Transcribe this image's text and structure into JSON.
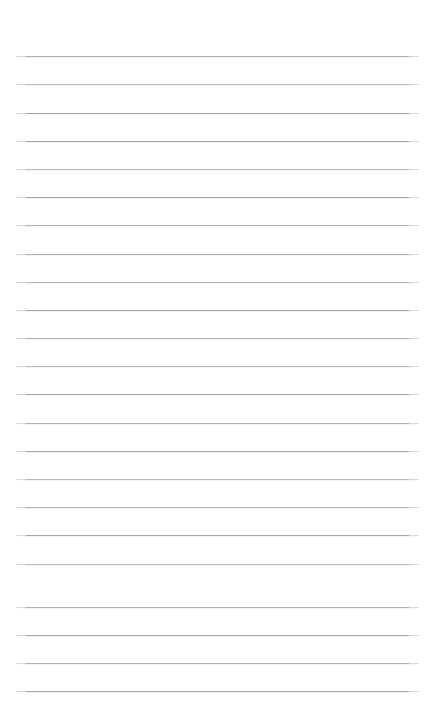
{
  "page": {
    "kind": "lined-note-paper",
    "title": "",
    "subtitle": "",
    "background_color": "#ffffff",
    "width_px": 436,
    "height_px": 721
  },
  "ruling": {
    "line_color": "#ababab",
    "line_color_light": "#b9b9b9",
    "line_color_dark": "#a6a6a6",
    "line_thickness_px": 1,
    "line_count": 23,
    "left_margin_px": 22,
    "right_edge_px": 413,
    "line_width_px": 391,
    "first_line_y_px": 56,
    "line_spacing_px": 28.2,
    "has_vertical_margin_rule": false,
    "has_holes": false,
    "has_header_text": false
  },
  "lines": [
    {
      "index": 1,
      "y": 56,
      "tone": "tone-b",
      "text": ""
    },
    {
      "index": 2,
      "y": 84,
      "tone": "tone-c",
      "text": ""
    },
    {
      "index": 3,
      "y": 113,
      "tone": "tone-a",
      "text": ""
    },
    {
      "index": 4,
      "y": 141,
      "tone": "tone-a",
      "text": ""
    },
    {
      "index": 5,
      "y": 169,
      "tone": "tone-c",
      "text": ""
    },
    {
      "index": 6,
      "y": 197,
      "tone": "tone-a",
      "text": ""
    },
    {
      "index": 7,
      "y": 225,
      "tone": "tone-b",
      "text": ""
    },
    {
      "index": 8,
      "y": 254,
      "tone": "tone-b",
      "text": ""
    },
    {
      "index": 9,
      "y": 282,
      "tone": "tone-c",
      "text": ""
    },
    {
      "index": 10,
      "y": 310,
      "tone": "tone-a",
      "text": ""
    },
    {
      "index": 11,
      "y": 338,
      "tone": "tone-b",
      "text": ""
    },
    {
      "index": 12,
      "y": 366,
      "tone": "tone-c",
      "text": ""
    },
    {
      "index": 13,
      "y": 394,
      "tone": "tone-a",
      "text": ""
    },
    {
      "index": 14,
      "y": 423,
      "tone": "tone-b",
      "text": ""
    },
    {
      "index": 15,
      "y": 451,
      "tone": "tone-a",
      "text": ""
    },
    {
      "index": 16,
      "y": 479,
      "tone": "tone-c",
      "text": ""
    },
    {
      "index": 17,
      "y": 507,
      "tone": "tone-b",
      "text": ""
    },
    {
      "index": 18,
      "y": 535,
      "tone": "tone-a",
      "text": ""
    },
    {
      "index": 19,
      "y": 564,
      "tone": "tone-c",
      "text": ""
    },
    {
      "index": 20,
      "y": 607,
      "tone": "tone-b",
      "text": ""
    },
    {
      "index": 21,
      "y": 635,
      "tone": "tone-a",
      "text": ""
    },
    {
      "index": 22,
      "y": 663,
      "tone": "tone-b",
      "text": ""
    },
    {
      "index": 23,
      "y": 691,
      "tone": "tone-a",
      "text": ""
    }
  ]
}
